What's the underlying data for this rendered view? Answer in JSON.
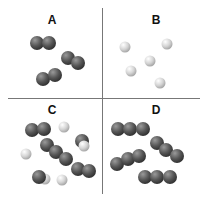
{
  "panels": [
    {
      "label": "A",
      "description": "diatomic molecules of one element (dark)"
    },
    {
      "label": "B",
      "description": "single atoms of one element (light)"
    },
    {
      "label": "C",
      "description": "mixture of diatomic, triatomic molecules and light atoms"
    },
    {
      "label": "D",
      "description": "triatomic molecules of one element (dark)"
    }
  ],
  "colors": {
    "dark_atom": "#555555",
    "light_atom": "#d4d4d4",
    "divider": "#777777"
  },
  "atoms": {
    "A": [
      {
        "x": 37,
        "y": 43,
        "t": "dark"
      },
      {
        "x": 49,
        "y": 43,
        "t": "dark"
      },
      {
        "x": 68,
        "y": 58,
        "t": "dark"
      },
      {
        "x": 78,
        "y": 63,
        "t": "dark"
      },
      {
        "x": 43,
        "y": 79,
        "t": "dark"
      },
      {
        "x": 55,
        "y": 75,
        "t": "dark"
      }
    ],
    "B": [
      {
        "x": 125,
        "y": 47,
        "t": "light"
      },
      {
        "x": 167,
        "y": 44,
        "t": "light"
      },
      {
        "x": 150,
        "y": 61,
        "t": "light"
      },
      {
        "x": 131,
        "y": 71,
        "t": "light"
      },
      {
        "x": 160,
        "y": 83,
        "t": "light"
      }
    ],
    "C": [
      {
        "x": 32,
        "y": 130,
        "t": "dark"
      },
      {
        "x": 44,
        "y": 129,
        "t": "dark"
      },
      {
        "x": 64,
        "y": 127,
        "t": "light"
      },
      {
        "x": 82,
        "y": 141,
        "t": "dark"
      },
      {
        "x": 84,
        "y": 146,
        "t": "light"
      },
      {
        "x": 26,
        "y": 154,
        "t": "light"
      },
      {
        "x": 47,
        "y": 145,
        "t": "dark"
      },
      {
        "x": 56,
        "y": 152,
        "t": "dark"
      },
      {
        "x": 66,
        "y": 159,
        "t": "dark"
      },
      {
        "x": 78,
        "y": 169,
        "t": "dark"
      },
      {
        "x": 89,
        "y": 171,
        "t": "dark"
      },
      {
        "x": 45,
        "y": 179,
        "t": "light"
      },
      {
        "x": 39,
        "y": 177,
        "t": "dark"
      },
      {
        "x": 62,
        "y": 180,
        "t": "light"
      }
    ],
    "D": [
      {
        "x": 118,
        "y": 129,
        "t": "dark"
      },
      {
        "x": 130,
        "y": 129,
        "t": "dark"
      },
      {
        "x": 143,
        "y": 129,
        "t": "dark"
      },
      {
        "x": 157,
        "y": 143,
        "t": "dark"
      },
      {
        "x": 166,
        "y": 150,
        "t": "dark"
      },
      {
        "x": 177,
        "y": 156,
        "t": "dark"
      },
      {
        "x": 117,
        "y": 164,
        "t": "dark"
      },
      {
        "x": 128,
        "y": 159,
        "t": "dark"
      },
      {
        "x": 139,
        "y": 156,
        "t": "dark"
      },
      {
        "x": 145,
        "y": 177,
        "t": "dark"
      },
      {
        "x": 157,
        "y": 177,
        "t": "dark"
      },
      {
        "x": 170,
        "y": 177,
        "t": "dark"
      }
    ]
  }
}
